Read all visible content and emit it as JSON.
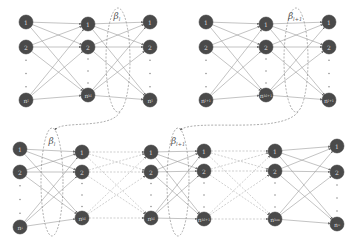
{
  "colors": {
    "node_fill": "#4a4a4a",
    "node_stroke": "#3a3a3a",
    "solid_edge": "#9a9a9a",
    "dashed_edge": "#b0b0b0",
    "ellipse": "#8a8a8a",
    "label_text": "#d8d8d8"
  },
  "diagrams": [
    {
      "name": "top-left-network",
      "layers": [
        {
          "x": 26,
          "nodes": [
            {
              "y": 22,
              "label": "1"
            },
            {
              "y": 47,
              "label": "2"
            },
            {
              "y": 100,
              "label": "n_l"
            }
          ]
        },
        {
          "x": 88,
          "nodes": [
            {
              "y": 24,
              "label": "1"
            },
            {
              "y": 47,
              "label": "2"
            },
            {
              "y": 95,
              "label": "n_h_l"
            }
          ]
        },
        {
          "x": 150,
          "nodes": [
            {
              "y": 22,
              "label": "1"
            },
            {
              "y": 47,
              "label": "2"
            },
            {
              "y": 100,
              "label": "n_l"
            }
          ]
        }
      ],
      "edge_style": [
        "solid",
        "solid"
      ],
      "beta": {
        "cx": 118,
        "cy": 60,
        "rx": 12,
        "ry": 52,
        "label": "β",
        "sub": "l",
        "lx": 117,
        "ly": 19
      }
    },
    {
      "name": "top-right-network",
      "layers": [
        {
          "x": 206,
          "nodes": [
            {
              "y": 22,
              "label": "1"
            },
            {
              "y": 47,
              "label": "2"
            },
            {
              "y": 100,
              "label": "n_l+1"
            }
          ]
        },
        {
          "x": 266,
          "nodes": [
            {
              "y": 24,
              "label": "1"
            },
            {
              "y": 47,
              "label": "2"
            },
            {
              "y": 95,
              "label": "n_h_l+1"
            }
          ]
        },
        {
          "x": 329,
          "nodes": [
            {
              "y": 22,
              "label": "1"
            },
            {
              "y": 47,
              "label": "2"
            },
            {
              "y": 100,
              "label": "n_l+1"
            }
          ]
        }
      ],
      "edge_style": [
        "solid",
        "solid"
      ],
      "beta": {
        "cx": 296,
        "cy": 60,
        "rx": 12,
        "ry": 52,
        "label": "β",
        "sub": "l+1",
        "lx": 295,
        "ly": 19
      }
    },
    {
      "name": "bottom-chain-network",
      "layers": [
        {
          "x": 20,
          "nodes": [
            {
              "y": 149,
              "label": "1"
            },
            {
              "y": 172,
              "label": "2"
            },
            {
              "y": 227,
              "label": "n_i"
            }
          ]
        },
        {
          "x": 82,
          "nodes": [
            {
              "y": 152,
              "label": "1"
            },
            {
              "y": 172,
              "label": "2"
            },
            {
              "y": 218,
              "label": "n_h_l"
            }
          ]
        },
        {
          "x": 151,
          "nodes": [
            {
              "y": 152,
              "label": "1"
            },
            {
              "y": 172,
              "label": "2"
            },
            {
              "y": 218,
              "label": "n_h_l"
            }
          ]
        },
        {
          "x": 204,
          "nodes": [
            {
              "y": 151,
              "label": "1"
            },
            {
              "y": 171,
              "label": "2"
            },
            {
              "y": 219,
              "label": "n_h_l+1"
            }
          ]
        },
        {
          "x": 275,
          "nodes": [
            {
              "y": 151,
              "label": "1"
            },
            {
              "y": 171,
              "label": "2"
            },
            {
              "y": 219,
              "label": "n_h_m"
            }
          ]
        },
        {
          "x": 337,
          "nodes": [
            {
              "y": 146,
              "label": "1"
            },
            {
              "y": 172,
              "label": "2"
            },
            {
              "y": 224,
              "label": "n_o"
            }
          ]
        }
      ],
      "edge_style": [
        "solid",
        "dashed",
        "solid",
        "dashed",
        "solid"
      ],
      "betas": [
        {
          "cx": 52,
          "cy": 182,
          "rx": 11,
          "ry": 54,
          "label": "β",
          "sub": "l",
          "lx": 52,
          "ly": 144
        },
        {
          "cx": 178,
          "cy": 182,
          "rx": 11,
          "ry": 54,
          "label": "β",
          "sub": "l+1",
          "lx": 178,
          "ly": 144
        }
      ]
    }
  ],
  "connectors": [
    {
      "from": "top-left β_l",
      "to": "bottom β_l",
      "path": "M 120 112 C 110 130, 60 120, 55 130"
    },
    {
      "from": "top-right β_l+1",
      "to": "bottom β_l+1",
      "path": "M 298 112 C 280 135, 195 118, 180 130"
    }
  ],
  "labels": {
    "beta_l": "β_l",
    "beta_l_plus_1": "β_l+1",
    "ellipsis": "⋮"
  }
}
